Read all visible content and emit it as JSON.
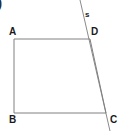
{
  "figure": {
    "width": 123,
    "height": 131,
    "background_color": "#ffffff",
    "stroke_color": "#808080",
    "label_color": "#1a1a1a",
    "stroke_width": 1,
    "corner_fragment": ")",
    "labels": {
      "a": "A",
      "b": "B",
      "c": "C",
      "d": "D",
      "s": "s"
    },
    "shape_points": "14,39 90,39 106,113 14,113",
    "line_s_points": "80,0 110,131"
  }
}
